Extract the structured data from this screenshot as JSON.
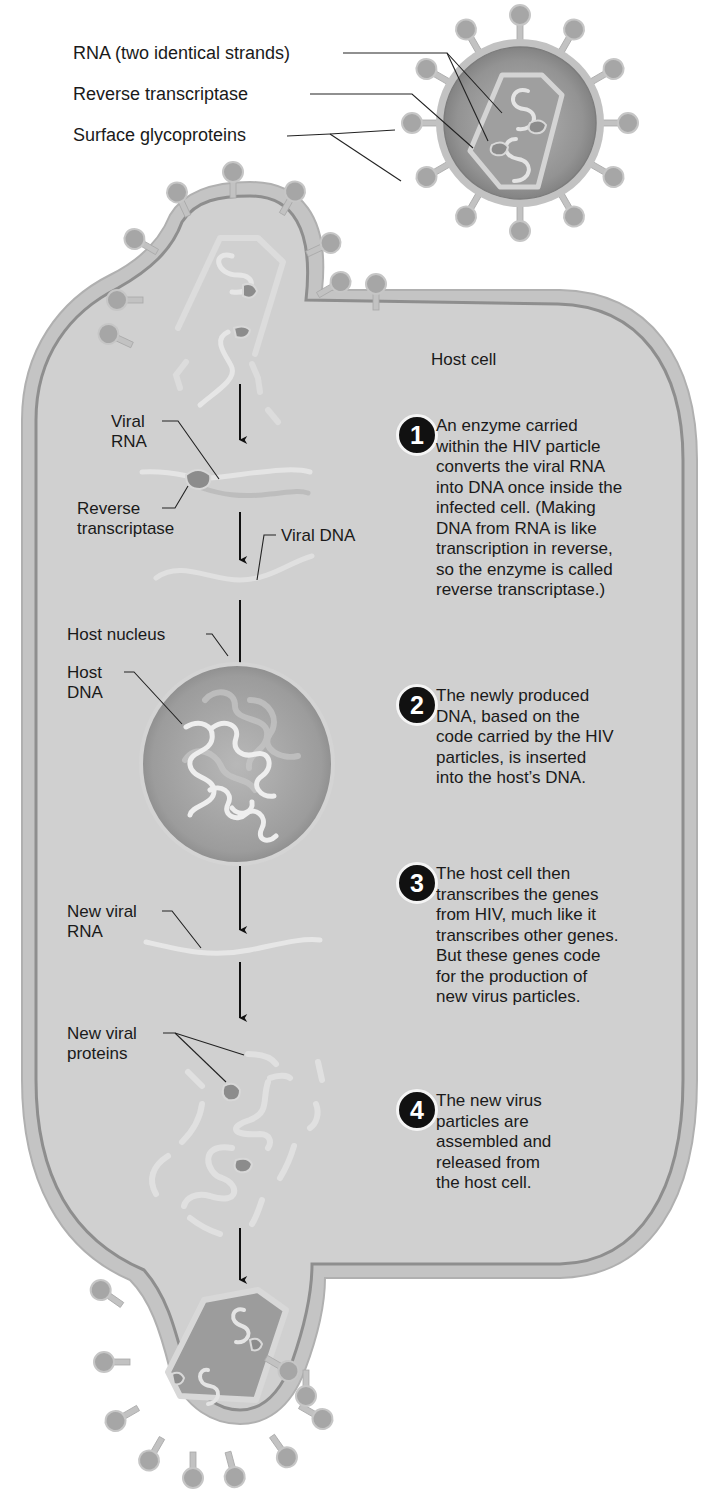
{
  "figure": {
    "virion_labels": {
      "rna": "RNA (two identical strands)",
      "reverse_transcriptase": "Reverse transcriptase",
      "surface_glycoproteins": "Surface glycoproteins"
    },
    "host_cell_label": "Host cell",
    "diagram_labels": {
      "viral_rna": "Viral\nRNA",
      "reverse_transcriptase": "Reverse\ntranscriptase",
      "viral_dna": "Viral DNA",
      "host_nucleus": "Host nucleus",
      "host_dna": "Host\nDNA",
      "new_viral_rna": "New viral\nRNA",
      "new_viral_proteins": "New viral\nproteins"
    },
    "steps": [
      {
        "number": "1",
        "text": "An enzyme carried\nwithin the HIV particle\nconverts the viral RNA\ninto DNA once inside the\ninfected cell. (Making\nDNA from RNA is like\ntranscription in reverse,\nso the enzyme is called\nreverse transcriptase.)"
      },
      {
        "number": "2",
        "text": "The newly produced\nDNA, based on the\ncode carried by the HIV\nparticles, is inserted\ninto the host’s DNA."
      },
      {
        "number": "3",
        "text": "The host cell then\ntranscribes the genes\nfrom HIV, much like it\ntranscribes other genes.\nBut these genes code\nfor the production of\nnew virus particles."
      },
      {
        "number": "4",
        "text": "The new virus\nparticles are\nassembled and\nreleased from\nthe host cell."
      }
    ],
    "colors": {
      "background": "#ffffff",
      "cytoplasm": "#cfcfcf",
      "membrane": "#bdbdbd",
      "membrane_shadow": "#8a8a8a",
      "virion_interior": "#9a9a9a",
      "capsid": "#d6d6d6",
      "glycoprotein": "#a9a9a9",
      "strand": "#e2e2e2",
      "enzyme": "#8c8c8c",
      "text": "#1a1a1a",
      "badge": "#111111"
    }
  }
}
